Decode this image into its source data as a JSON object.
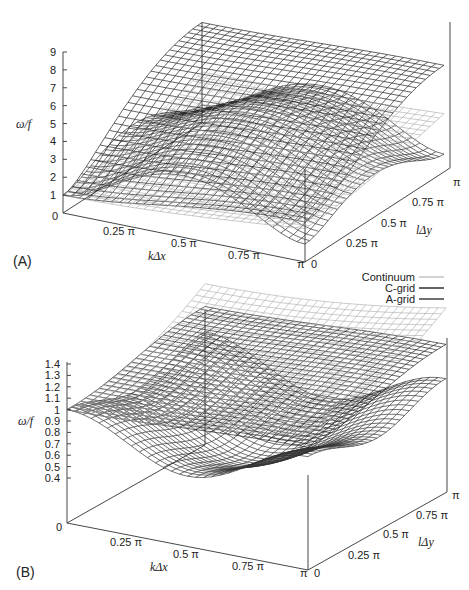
{
  "chart_data": [
    {
      "panel": "(A)",
      "type": "surface3d",
      "zlabel": "ω/f",
      "xlabel": "kΔx",
      "ylabel": "lΔy",
      "z_ticks": [
        "0",
        "1",
        "2",
        "3",
        "4",
        "5",
        "6",
        "7",
        "8",
        "9"
      ],
      "zlim": [
        0,
        9
      ],
      "x_ticks": [
        "0.25 π",
        "0.5 π",
        "0.75 π",
        "π"
      ],
      "y_ticks": [
        "0",
        "0.25 π",
        "0.5 π",
        "0.75 π",
        "π"
      ],
      "origin_label": "0",
      "series": [
        {
          "name": "Continuum",
          "color": "#a8a8a8",
          "corners": {
            "x0y0": 1.0,
            "xpiy0": 3.4,
            "x0ypi": 8.2,
            "xpiypi": 8.5
          },
          "note": "monotonically increasing; highest surface"
        },
        {
          "name": "C-grid",
          "color": "#222222",
          "corners": {
            "x0y0": 1.0,
            "xpiy0": 3.0,
            "x0ypi": 6.0,
            "xpiypi": 6.2
          },
          "note": "middle surface, saturates near 6"
        },
        {
          "name": "A-grid",
          "color": "#333333",
          "corners": {
            "x0y0": 1.0,
            "xpiy0": 1.0,
            "x0ypi": 1.0,
            "xpiypi": 1.0
          },
          "peak": 3.2,
          "note": "rises to ~3 at mid-wavenumber then falls back to 1 at π"
        }
      ]
    },
    {
      "panel": "(B)",
      "type": "surface3d",
      "zlabel": "ω/f",
      "xlabel": "kΔx",
      "ylabel": "lΔy",
      "z_ticks": [
        "0.4",
        "0.5",
        "0.6",
        "0.7",
        "0.8",
        "0.9",
        "1",
        "1.1",
        "1.2",
        "1.3",
        "1.4"
      ],
      "zlim": [
        0.4,
        1.4
      ],
      "x_ticks": [
        "0.25 π",
        "0.5 π",
        "0.75 π",
        "π"
      ],
      "y_ticks": [
        "0",
        "0.25 π",
        "0.5 π",
        "0.75 π",
        "π"
      ],
      "origin_label": "0",
      "series": [
        {
          "name": "Continuum",
          "color": "#a8a8a8",
          "corners": {
            "x0y0": 1.0,
            "xpiy0": 1.2,
            "x0ypi": 1.4,
            "xpiypi": 1.42
          }
        },
        {
          "name": "C-grid",
          "color": "#222222",
          "corners": {
            "x0y0": 1.0,
            "xpiy0": 1.08,
            "x0ypi": 1.22,
            "xpiypi": 1.22
          }
        },
        {
          "name": "A-grid",
          "color": "#333333",
          "corners": {
            "x0y0": 1.0,
            "xpiy0": 1.0,
            "x0ypi": 1.0,
            "xpiypi": 1.0
          },
          "trough": 0.45,
          "note": "dips below 1 at mid-wavenumbers"
        }
      ]
    }
  ],
  "legend": {
    "items": [
      {
        "label": "Continuum",
        "color": "#b0b0b0"
      },
      {
        "label": "C-grid",
        "color": "#222222"
      },
      {
        "label": "A-grid",
        "color": "#333333"
      }
    ]
  },
  "panels": {
    "a": {
      "label": "(A)",
      "zlabel": "ω/f",
      "xlabel": "kΔx",
      "ylabel": "lΔy",
      "origin": "0",
      "xend": "π",
      "yend": "π",
      "y0": "0",
      "xticks": [
        "0.25 π",
        "0.5 π",
        "0.75 π"
      ],
      "yticks": [
        "0.25 π",
        "0.5 π",
        "0.75 π"
      ],
      "zticks": [
        "9",
        "8",
        "7",
        "6",
        "5",
        "4",
        "3",
        "2",
        "1"
      ]
    },
    "b": {
      "label": "(B)",
      "zlabel": "ω/f",
      "xlabel": "kΔx",
      "ylabel": "lΔy",
      "origin": "0",
      "xend": "π",
      "yend": "π",
      "y0": "0",
      "xticks": [
        "0.25 π",
        "0.5 π",
        "0.75 π"
      ],
      "yticks": [
        "0.25 π",
        "0.5 π",
        "0.75 π"
      ],
      "zticks": [
        "1.4",
        "1.3",
        "1.2",
        "1.1",
        "1",
        "0.9",
        "0.8",
        "0.7",
        "0.6",
        "0.5",
        "0.4"
      ]
    }
  }
}
